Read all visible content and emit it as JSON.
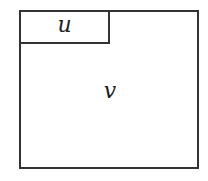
{
  "diagram": {
    "type": "region-partition",
    "outer_region": {
      "label": "v"
    },
    "inner_region": {
      "label": "u",
      "position": "top-left"
    },
    "colors": {
      "stroke": "#333333",
      "fill": "#ffffff",
      "text": "#222222"
    }
  }
}
